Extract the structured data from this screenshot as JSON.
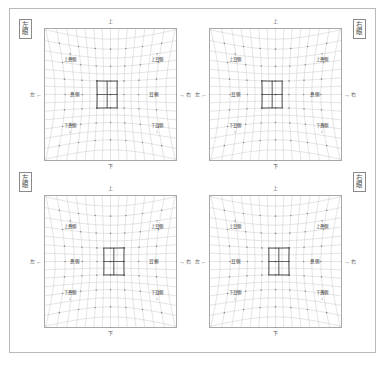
{
  "document": {
    "title": "視野歪み格子チャート",
    "page_background": "#ffffff",
    "frame_color": "#b9b9b9"
  },
  "corner_tags": [
    {
      "id": "top-left",
      "chars": [
        "左",
        "眼"
      ],
      "text": "左眼"
    },
    {
      "id": "top-right",
      "chars": [
        "右",
        "眼"
      ],
      "text": "右眼"
    },
    {
      "id": "bottom-left",
      "chars": [
        "左",
        "眼"
      ],
      "text": "左眼"
    },
    {
      "id": "bottom-right",
      "chars": [
        "右",
        "眼"
      ],
      "text": "右眼"
    }
  ],
  "panels": [
    {
      "id": "top-left",
      "position": "top-left",
      "mirrored": false,
      "axis": {
        "top": "上",
        "bottom": "下",
        "left_arrow": "←",
        "left_label": "左",
        "right_arrow": "→",
        "right_label": "右"
      },
      "inner_notes": {
        "top_left": {
          "tick": "↑",
          "text": "上鼻側"
        },
        "top_right": {
          "tick": "↑",
          "text": "上耳側"
        },
        "bottom_left": {
          "tick": "↓",
          "text": "下鼻側"
        },
        "bottom_right": {
          "tick": "↓",
          "text": "下耳側"
        },
        "mid_left": {
          "text": "鼻側"
        },
        "mid_right": {
          "text": "耳側"
        }
      }
    },
    {
      "id": "top-right",
      "position": "top-right",
      "mirrored": true,
      "axis": {
        "top": "上",
        "bottom": "下",
        "left_arrow": "←",
        "left_label": "左",
        "right_arrow": "→",
        "right_label": "右"
      },
      "inner_notes": {
        "top_left": {
          "tick": "↑",
          "text": "上耳側"
        },
        "top_right": {
          "tick": "↑",
          "text": "上鼻側"
        },
        "bottom_left": {
          "tick": "↓",
          "text": "下耳側"
        },
        "bottom_right": {
          "tick": "↓",
          "text": "下鼻側"
        },
        "mid_left": {
          "text": "耳側"
        },
        "mid_right": {
          "text": "鼻側"
        }
      }
    },
    {
      "id": "bottom-left",
      "position": "bottom-left",
      "mirrored": false,
      "axis": {
        "top": "上",
        "bottom": "下",
        "left_arrow": "←",
        "left_label": "左",
        "right_arrow": "→",
        "right_label": "右"
      },
      "inner_notes": {
        "top_left": {
          "tick": "↑",
          "text": "上鼻側"
        },
        "top_right": {
          "tick": "↑",
          "text": "上耳側"
        },
        "bottom_left": {
          "tick": "↓",
          "text": "下鼻側"
        },
        "bottom_right": {
          "tick": "↓",
          "text": "下耳側"
        },
        "mid_left": {
          "text": "鼻側"
        },
        "mid_right": {
          "text": "耳側"
        }
      }
    },
    {
      "id": "bottom-right",
      "position": "bottom-right",
      "mirrored": true,
      "axis": {
        "top": "上",
        "bottom": "下",
        "left_arrow": "←",
        "left_label": "左",
        "right_arrow": "→",
        "right_label": "右"
      },
      "inner_notes": {
        "top_left": {
          "tick": "↑",
          "text": "上耳側"
        },
        "top_right": {
          "tick": "↑",
          "text": "上鼻側"
        },
        "bottom_left": {
          "tick": "↓",
          "text": "下耳側"
        },
        "bottom_right": {
          "tick": "↓",
          "text": "下鼻側"
        },
        "mid_left": {
          "text": "耳側"
        },
        "mid_right": {
          "text": "鼻側"
        }
      }
    }
  ],
  "chart_data": {
    "type": "line",
    "grid": {
      "columns": 16,
      "rows": 16,
      "line_color": "#b0b0b0",
      "line_width": 0.35,
      "distortion_type": "barrel",
      "distortion_strength": 0.26,
      "node_marker_color": "#8d8d8d",
      "node_marker_size": 0.8
    },
    "highlight_box": {
      "line_color": "#3a3a3a",
      "line_width": 1.0,
      "spans_cells_x": 2,
      "spans_cells_y": 2,
      "panels": {
        "top-left": {
          "grid_x0": 6,
          "grid_y0": 6,
          "grid_x1": 9,
          "grid_y1": 10
        },
        "top-right": {
          "grid_x0": 7,
          "grid_y0": 6,
          "grid_x1": 10,
          "grid_y1": 10
        },
        "bottom-left": {
          "grid_x0": 7,
          "grid_y0": 6,
          "grid_x1": 10,
          "grid_y1": 10
        },
        "bottom-right": {
          "grid_x0": 6,
          "grid_y0": 6,
          "grid_x1": 9,
          "grid_y1": 10
        }
      }
    },
    "axis_ranges": {
      "x": [
        -1,
        1
      ],
      "y": [
        -1,
        1
      ]
    },
    "legend": null,
    "gridlines": true
  }
}
